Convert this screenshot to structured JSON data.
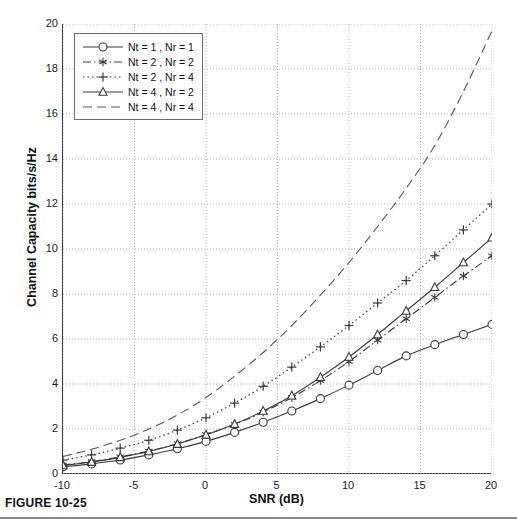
{
  "figure": {
    "caption": "FIGURE 10-25"
  },
  "chart_data": {
    "type": "line",
    "title": "",
    "xlabel": "SNR (dB)",
    "ylabel": "Channel Capacity bits/s/Hz",
    "xlim": [
      -10,
      20
    ],
    "ylim": [
      0,
      20
    ],
    "xticks": [
      -10,
      -5,
      0,
      5,
      10,
      15,
      20
    ],
    "yticks": [
      0,
      2,
      4,
      6,
      8,
      10,
      12,
      14,
      16,
      18,
      20
    ],
    "grid": true,
    "grid_style": "dotted",
    "legend_position": "top-left",
    "x": [
      -10,
      -8,
      -6,
      -4,
      -2,
      0,
      2,
      4,
      6,
      8,
      10,
      12,
      14,
      16,
      18,
      20
    ],
    "series": [
      {
        "name": "Nt = 1 , Nr = 1",
        "label": "Nt = 1 , Nr = 1",
        "line_style": "solid",
        "marker": "circle",
        "color": "#3a3a3a",
        "values": [
          0.32,
          0.45,
          0.62,
          0.85,
          1.12,
          1.45,
          1.85,
          2.3,
          2.8,
          3.35,
          3.95,
          4.6,
          5.25,
          5.75,
          6.2,
          6.65
        ]
      },
      {
        "name": "Nt = 2 , Nr = 2",
        "label": "Nt = 2 , Nr = 2",
        "line_style": "dash-dot",
        "marker": "star",
        "color": "#3a3a3a",
        "values": [
          0.4,
          0.55,
          0.76,
          1.02,
          1.35,
          1.75,
          2.2,
          2.75,
          3.4,
          4.15,
          5.0,
          5.95,
          6.9,
          7.85,
          8.8,
          9.7
        ]
      },
      {
        "name": "Nt = 2 , Nr = 4",
        "label": "Nt = 2 , Nr = 4",
        "line_style": "dotted",
        "marker": "plus",
        "color": "#3a3a3a",
        "values": [
          0.62,
          0.85,
          1.15,
          1.5,
          1.95,
          2.5,
          3.15,
          3.9,
          4.75,
          5.65,
          6.6,
          7.6,
          8.6,
          9.7,
          10.85,
          12.0
        ]
      },
      {
        "name": "Nt = 4 , Nr = 2",
        "label": "Nt = 4 , Nr = 2",
        "line_style": "solid",
        "marker": "triangle",
        "color": "#3a3a3a",
        "values": [
          0.38,
          0.53,
          0.74,
          1.0,
          1.33,
          1.74,
          2.22,
          2.8,
          3.48,
          4.3,
          5.2,
          6.2,
          7.25,
          8.3,
          9.4,
          10.5
        ]
      },
      {
        "name": "Nt = 4 , Nr = 4",
        "label": "Nt = 4 , Nr = 4",
        "line_style": "dashed",
        "marker": "none",
        "color": "#555555",
        "values": [
          0.78,
          1.1,
          1.5,
          2.0,
          2.62,
          3.4,
          4.35,
          5.4,
          6.6,
          7.95,
          9.4,
          11.0,
          12.7,
          14.6,
          17.0,
          19.7
        ]
      }
    ]
  }
}
